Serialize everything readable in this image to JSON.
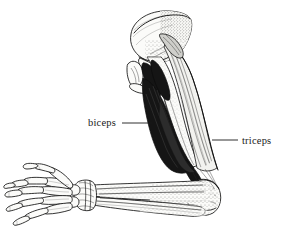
{
  "figure": {
    "style": "pen-and-ink line engraving with stipple shading",
    "background_color": "#ffffff",
    "ink_color": "#111111",
    "width": 287,
    "height": 235
  },
  "labels": [
    {
      "id": "biceps",
      "text": "biceps",
      "text_x": 88,
      "text_y": 126,
      "leader_from_x": 122,
      "leader_from_y": 123,
      "leader_to_x": 152,
      "leader_to_y": 123,
      "anchor": "start",
      "side": "left"
    },
    {
      "id": "triceps",
      "text": "triceps",
      "text_x": 242,
      "text_y": 144,
      "leader_from_x": 238,
      "leader_from_y": 140,
      "leader_to_x": 212,
      "leader_to_y": 140,
      "anchor": "start",
      "side": "right"
    }
  ],
  "anatomy_parts": [
    {
      "id": "scapula",
      "name": "scapula",
      "shading": "stipple"
    },
    {
      "id": "humerus",
      "name": "humerus",
      "shading": "outline"
    },
    {
      "id": "biceps-muscle",
      "name": "biceps brachii",
      "shading": "solid-black"
    },
    {
      "id": "triceps-muscle",
      "name": "triceps brachii",
      "shading": "striated-light"
    },
    {
      "id": "ulna",
      "name": "ulna",
      "shading": "stipple"
    },
    {
      "id": "radius",
      "name": "radius",
      "shading": "outline"
    },
    {
      "id": "carpals",
      "name": "carpal bones",
      "shading": "hatched"
    },
    {
      "id": "metacarpals",
      "name": "metacarpals",
      "shading": "outline"
    },
    {
      "id": "phalanges",
      "name": "phalanges",
      "shading": "outline"
    }
  ],
  "colors": {
    "background": "#ffffff",
    "ink": "#111111",
    "muscle_dark": "#151515",
    "muscle_mid": "#cfcfcb",
    "bone": "#fbfbf9"
  }
}
